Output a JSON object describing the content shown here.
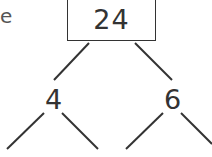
{
  "diagram": {
    "type": "factor-tree",
    "partial_text_left": "e",
    "root": {
      "value": "24"
    },
    "children": [
      {
        "value": "4",
        "branches": 2
      },
      {
        "value": "6",
        "branches": 2
      }
    ]
  }
}
